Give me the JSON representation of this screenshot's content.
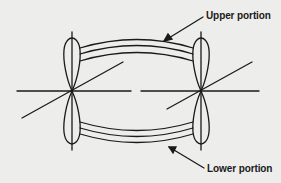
{
  "diagram": {
    "labels": {
      "upper": "Upper portion",
      "lower": "Lower portion"
    },
    "colors": {
      "line": "#1a1a1a",
      "background": "#ededeb"
    },
    "orbitals": [
      {
        "id": "left",
        "center_x": 72,
        "center_y": 91
      },
      {
        "id": "right",
        "center_x": 201,
        "center_y": 91
      }
    ],
    "bond_portions": [
      {
        "id": "upper",
        "arc_lines": 3
      },
      {
        "id": "lower",
        "arc_lines": 3
      }
    ]
  }
}
